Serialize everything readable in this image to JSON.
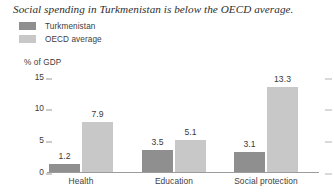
{
  "chart_data": {
    "type": "bar",
    "title": "Social spending in Turkmenistan is below the OECD average.",
    "xlabel": "",
    "ylabel": "% of GDP",
    "ylim": [
      0,
      16.5
    ],
    "yticks": [
      15,
      10,
      5,
      0
    ],
    "grid": false,
    "legend_position": "top-left",
    "categories": [
      "Health",
      "Education",
      "Social protection"
    ],
    "series": [
      {
        "name": "Turkmenistan",
        "color": "#8f8f8f",
        "values": [
          1.2,
          3.5,
          3.1
        ],
        "labels": [
          "1.2",
          "3.5",
          "3.1"
        ]
      },
      {
        "name": "OECD average",
        "color": "#c8c8c8",
        "values": [
          7.9,
          5.1,
          13.3
        ],
        "labels": [
          "7.9",
          "5.1",
          "13.3"
        ]
      }
    ]
  },
  "axis": {
    "unit_label": "% of GDP",
    "tick_labels": [
      "15",
      "10",
      "5",
      "0"
    ]
  }
}
